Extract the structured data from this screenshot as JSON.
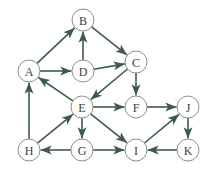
{
  "diagram": {
    "type": "directed-graph",
    "node_radius": 11,
    "colors": {
      "edge": "#3d5a4d",
      "node_stroke": "#8a8f8c",
      "label": "#3b3f3d",
      "background": "#ffffff"
    },
    "nodes": [
      {
        "id": "A",
        "label": "A",
        "x": 29,
        "y": 71
      },
      {
        "id": "B",
        "label": "B",
        "x": 83,
        "y": 20
      },
      {
        "id": "C",
        "label": "C",
        "x": 136,
        "y": 62
      },
      {
        "id": "D",
        "label": "D",
        "x": 83,
        "y": 71
      },
      {
        "id": "E",
        "label": "E",
        "x": 82,
        "y": 107
      },
      {
        "id": "F",
        "label": "F",
        "x": 136,
        "y": 107
      },
      {
        "id": "G",
        "label": "G",
        "x": 82,
        "y": 150
      },
      {
        "id": "H",
        "label": "H",
        "x": 29,
        "y": 150
      },
      {
        "id": "I",
        "label": "I",
        "x": 136,
        "y": 150
      },
      {
        "id": "J",
        "label": "J",
        "x": 188,
        "y": 107
      },
      {
        "id": "K",
        "label": "K",
        "x": 188,
        "y": 150
      }
    ],
    "edges": [
      {
        "from": "A",
        "to": "B"
      },
      {
        "from": "A",
        "to": "D"
      },
      {
        "from": "D",
        "to": "B"
      },
      {
        "from": "B",
        "to": "C"
      },
      {
        "from": "D",
        "to": "C"
      },
      {
        "from": "C",
        "to": "E"
      },
      {
        "from": "C",
        "to": "F"
      },
      {
        "from": "E",
        "to": "A"
      },
      {
        "from": "E",
        "to": "F"
      },
      {
        "from": "E",
        "to": "G"
      },
      {
        "from": "E",
        "to": "I"
      },
      {
        "from": "H",
        "to": "A"
      },
      {
        "from": "H",
        "to": "E"
      },
      {
        "from": "G",
        "to": "H"
      },
      {
        "from": "G",
        "to": "I"
      },
      {
        "from": "F",
        "to": "J"
      },
      {
        "from": "I",
        "to": "J"
      },
      {
        "from": "J",
        "to": "K"
      },
      {
        "from": "K",
        "to": "I"
      }
    ]
  }
}
